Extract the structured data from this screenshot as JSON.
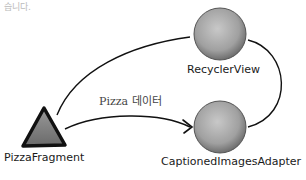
{
  "header_fragment": "습니다.",
  "nodes": {
    "fragment": {
      "label": "PizzaFragment",
      "shape": "triangle"
    },
    "recycler": {
      "label": "RecyclerView",
      "shape": "circle"
    },
    "adapter": {
      "label": "CaptionedImagesAdapter",
      "shape": "circle"
    }
  },
  "edges": [
    {
      "from": "fragment",
      "to": "recycler",
      "label": ""
    },
    {
      "from": "fragment",
      "to": "adapter",
      "label": "Pizza 데이터",
      "arrow": true
    },
    {
      "from": "recycler",
      "to": "adapter",
      "label": ""
    }
  ],
  "colors": {
    "node_fill": "#a8a8a8",
    "stroke": "#111111",
    "background": "#ffffff"
  }
}
